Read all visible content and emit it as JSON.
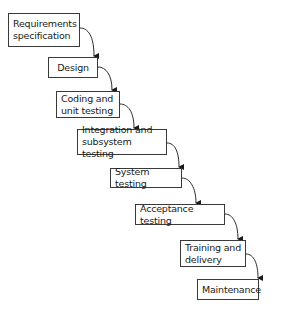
{
  "diagram": {
    "type": "waterfall-model",
    "line_color": "#3a3a3a",
    "stages": [
      {
        "label": "Requirements\nspecification",
        "x": 8,
        "y": 13,
        "w": 72,
        "h": 34
      },
      {
        "label": "Design",
        "x": 48,
        "y": 57,
        "w": 50,
        "h": 21
      },
      {
        "label": "Coding and\nunit testing",
        "x": 56,
        "y": 91,
        "w": 64,
        "h": 27
      },
      {
        "label": "Integration and\nsubsystem testing",
        "x": 77,
        "y": 129,
        "w": 90,
        "h": 26
      },
      {
        "label": "System testing",
        "x": 110,
        "y": 168,
        "w": 72,
        "h": 20
      },
      {
        "label": "Acceptance testing",
        "x": 135,
        "y": 204,
        "w": 90,
        "h": 21
      },
      {
        "label": "Training and\ndelivery",
        "x": 180,
        "y": 240,
        "w": 66,
        "h": 27
      },
      {
        "label": "Maintenance",
        "x": 197,
        "y": 279,
        "w": 62,
        "h": 21
      }
    ]
  }
}
